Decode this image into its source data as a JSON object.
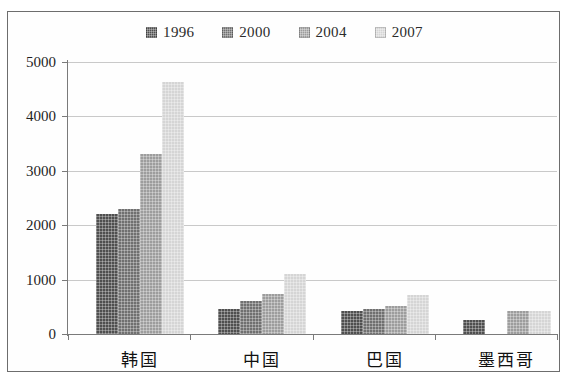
{
  "chart_data": {
    "type": "bar",
    "title": "",
    "subtitle": "",
    "xlabel": "",
    "ylabel": "",
    "categories": [
      "韩国",
      "中国",
      "巴国",
      "墨西哥"
    ],
    "series": [
      {
        "name": "1996",
        "color": "#4f4f4f",
        "values": [
          2210,
          465,
          420,
          250
        ]
      },
      {
        "name": "2000",
        "color": "#707070",
        "values": [
          2300,
          605,
          465,
          0
        ]
      },
      {
        "name": "2004",
        "color": "#9d9d9d",
        "values": [
          3300,
          740,
          520,
          430
        ]
      },
      {
        "name": "2007",
        "color": "#d5d5d5",
        "values": [
          4640,
          1095,
          720,
          430
        ]
      }
    ],
    "ylim": [
      0,
      5000
    ],
    "ytick_values": [
      0,
      1000,
      2000,
      3000,
      4000,
      5000
    ],
    "ytick_labels": [
      "0",
      "1000",
      "2000",
      "3000",
      "4000",
      "5000"
    ],
    "grid": true,
    "grid_axis": "y",
    "legend_position": "top-center",
    "annotations": []
  },
  "legend": {
    "items": [
      {
        "label": "1996",
        "color": "#4f4f4f"
      },
      {
        "label": "2000",
        "color": "#707070"
      },
      {
        "label": "2004",
        "color": "#9d9d9d"
      },
      {
        "label": "2007",
        "color": "#d5d5d5"
      }
    ]
  },
  "colors": {
    "frame_border": "#6d6d6d",
    "axis": "#7a7a7a",
    "gridline": "#c9c9c9",
    "background": "#ffffff",
    "text": "#1f1f1f"
  }
}
